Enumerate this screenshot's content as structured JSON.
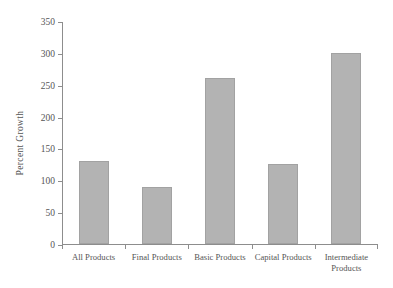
{
  "chart_data": {
    "type": "bar",
    "title": "",
    "subtitle": "",
    "xlabel": "",
    "ylabel": "Percent Growth",
    "categories": [
      "All Products",
      "Final Products",
      "Basic Products",
      "Capital Products",
      "Intermediate Products"
    ],
    "values": [
      130,
      90,
      260,
      125,
      300
    ],
    "ylim": [
      0,
      350
    ],
    "ytick_labels": [
      "0",
      "50",
      "100",
      "150",
      "200",
      "250",
      "300",
      "350"
    ],
    "ytick_values": [
      0,
      50,
      100,
      150,
      200,
      250,
      300,
      350
    ],
    "grid": false,
    "legend": false,
    "legend_position": "none",
    "bar_color": "#b3b3b3",
    "bar_edge_color": "#a2a2a2",
    "axis_color": "#8d8d8d",
    "text_color": "#555555",
    "background_color": "#ffffff"
  }
}
